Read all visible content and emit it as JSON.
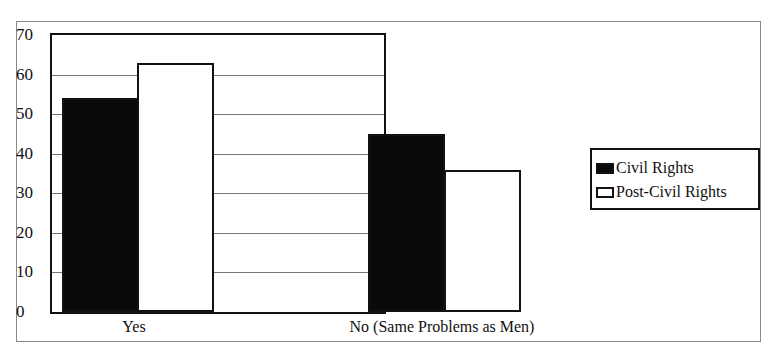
{
  "chart_data": {
    "type": "bar",
    "title": "",
    "xlabel": "",
    "ylabel": "",
    "categories": [
      "Yes",
      "No (Same Problems as Men)"
    ],
    "series": [
      {
        "name": "Civil Rights",
        "values": [
          54,
          45
        ],
        "color": "#0a0a0a"
      },
      {
        "name": "Post-Civil Rights",
        "values": [
          63,
          36
        ],
        "color": "#ffffff"
      }
    ],
    "ylim": [
      0,
      70
    ],
    "yticks": [
      0,
      10,
      20,
      30,
      40,
      50,
      60,
      70
    ],
    "grid": true,
    "legend_position": "right"
  },
  "legend": {
    "items": [
      {
        "label": "Civil Rights"
      },
      {
        "label": "Post-Civil Rights"
      }
    ]
  }
}
